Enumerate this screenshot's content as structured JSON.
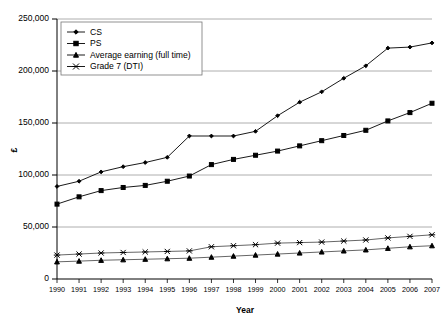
{
  "chart_data": {
    "type": "line",
    "title": "",
    "xlabel": "Year",
    "ylabel": "£",
    "grid": true,
    "legend_position": "top-left",
    "xlim": [
      1990,
      2007
    ],
    "ylim": [
      0,
      250000
    ],
    "ytick_labels": [
      "0",
      "50,000",
      "100,000",
      "150,000",
      "200,000",
      "250,000"
    ],
    "ytick_values": [
      0,
      50000,
      100000,
      150000,
      200000,
      250000
    ],
    "categories": [
      1990,
      1991,
      1992,
      1993,
      1994,
      1995,
      1996,
      1997,
      1998,
      1999,
      2000,
      2001,
      2002,
      2003,
      2004,
      2005,
      2006,
      2007
    ],
    "xtick_labels": [
      "1990",
      "1991",
      "1992",
      "1993",
      "1994",
      "1995",
      "1996",
      "1997",
      "1998",
      "1999",
      "2000",
      "2001",
      "2002",
      "2003",
      "2004",
      "2005",
      "2006",
      "2007"
    ],
    "series": [
      {
        "name": "CS",
        "marker": "diamond",
        "color": "#000000",
        "values": [
          89000,
          94000,
          103000,
          108000,
          112000,
          117000,
          137500,
          137500,
          137500,
          142000,
          157000,
          170000,
          180000,
          193000,
          205000,
          222000,
          223000,
          227000
        ]
      },
      {
        "name": "PS",
        "marker": "square",
        "color": "#000000",
        "values": [
          72000,
          79000,
          85000,
          88000,
          90000,
          94000,
          99000,
          110000,
          115000,
          119000,
          123000,
          128000,
          133000,
          138000,
          143000,
          152000,
          160000,
          169000
        ]
      },
      {
        "name": "Average earning (full time)",
        "marker": "triangle",
        "color": "#000000",
        "values": [
          16500,
          17200,
          18000,
          18500,
          19000,
          19500,
          20000,
          21000,
          22000,
          23000,
          24000,
          25000,
          26000,
          27000,
          28000,
          29500,
          31000,
          32000
        ]
      },
      {
        "name": "Grade 7 (DTI)",
        "marker": "cross",
        "color": "#000000",
        "values": [
          23000,
          24000,
          25000,
          25500,
          26000,
          26500,
          27000,
          31000,
          32000,
          33000,
          34500,
          35000,
          35500,
          36500,
          37500,
          39500,
          41000,
          42500
        ]
      }
    ]
  },
  "legend": {
    "items": [
      {
        "label": "CS",
        "marker": "diamond"
      },
      {
        "label": "PS",
        "marker": "square"
      },
      {
        "label": "Average earning (full time)",
        "marker": "triangle"
      },
      {
        "label": "Grade 7 (DTI)",
        "marker": "cross"
      }
    ]
  },
  "axis": {
    "x_title": "Year",
    "y_title": "£"
  }
}
